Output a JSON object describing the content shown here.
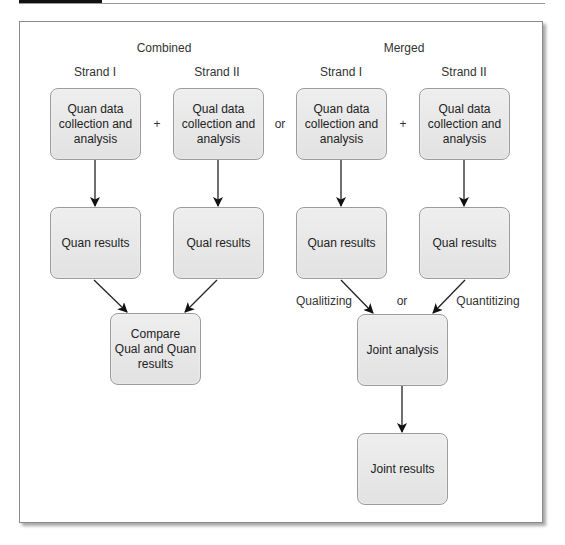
{
  "diagram": {
    "sections": [
      {
        "id": "combined",
        "title": "Combined",
        "strands": [
          "Strand I",
          "Strand II"
        ]
      },
      {
        "id": "merged",
        "title": "Merged",
        "strands": [
          "Strand I",
          "Strand II"
        ]
      }
    ],
    "operators": {
      "plus_left": "+",
      "or_middle": "or",
      "plus_right": "+",
      "or_bottom": "or"
    },
    "boxes": {
      "combined_quan_collect": "Quan data\ncollection and\nanalysis",
      "combined_qual_collect": "Qual data\ncollection and\nanalysis",
      "combined_quan_results": "Quan results",
      "combined_qual_results": "Qual results",
      "compare": "Compare\nQual and Quan\nresults",
      "merged_quan_collect": "Quan data\ncollection and\nanalysis",
      "merged_qual_collect": "Qual data\ncollection and\nanalysis",
      "merged_quan_results": "Quan results",
      "merged_qual_results": "Qual results",
      "joint_analysis": "Joint analysis",
      "joint_results": "Joint results"
    },
    "edge_labels": {
      "qualitizing": "Qualitizing",
      "quantitizing": "Quantitizing"
    }
  }
}
